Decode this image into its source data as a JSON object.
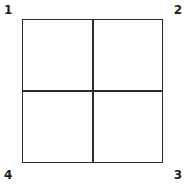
{
  "figure": {
    "kind": "square-divided-into-four-quadrants",
    "stroke_color": "#2b2b2b",
    "fill_color": "#ffffff",
    "background_color": "#ffffff",
    "label_color": "#1c1c1c"
  },
  "corner_labels": [
    {
      "id": "1",
      "text": "1",
      "position": "top-left"
    },
    {
      "id": "2",
      "text": "2",
      "position": "top-right"
    },
    {
      "id": "3",
      "text": "3",
      "position": "bottom-right"
    },
    {
      "id": "4",
      "text": "4",
      "position": "bottom-left"
    }
  ],
  "quadrants": [
    {
      "id": "top-left",
      "text": ""
    },
    {
      "id": "top-right",
      "text": ""
    },
    {
      "id": "bottom-right",
      "text": ""
    },
    {
      "id": "bottom-left",
      "text": ""
    }
  ]
}
